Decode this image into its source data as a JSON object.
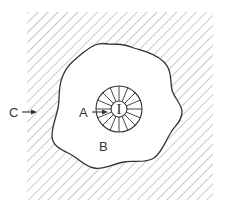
{
  "diagram": {
    "type": "region-schematic",
    "labels": {
      "inner": "I",
      "a": "A",
      "b": "B",
      "c": "C"
    },
    "regions": [
      {
        "id": "I",
        "description": "inner circle core"
      },
      {
        "id": "A",
        "description": "radially segmented ring around core"
      },
      {
        "id": "B",
        "description": "irregular blob region (unhatched)"
      },
      {
        "id": "C",
        "description": "hatched outer square region"
      }
    ],
    "ring_segments": 16,
    "colors": {
      "stroke": "#333333",
      "hatch": "#9a9a9a",
      "background": "#ffffff"
    }
  }
}
